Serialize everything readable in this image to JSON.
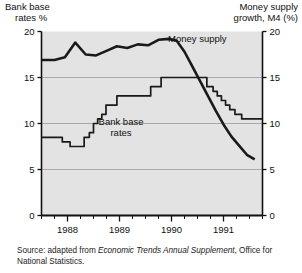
{
  "figure": {
    "left_axis_title_line1": "Bank base",
    "left_axis_title_line2": "rates %",
    "right_axis_title_line1": "Money supply",
    "right_axis_title_line2": "growth, M4 (%)",
    "money_supply_label": "Money supply",
    "bank_base_label_line1": "Bank base",
    "bank_base_label_line2": "rates",
    "source_prefix": "Source: adapted from ",
    "source_italic": "Economic Trends Annual Supplement",
    "source_suffix": ", Office for National Statistics.",
    "plot_bg": "#e3e3e3",
    "line_color": "#1a1a1a",
    "grid_color": "#9a9a9a",
    "axis_color": "#111111"
  },
  "chart_data": {
    "type": "line",
    "title": "",
    "xlabel": "",
    "ylabel": "Bank base rates %",
    "ylabel_right": "Money supply growth, M4 (%)",
    "ylim": [
      0,
      20
    ],
    "yticks": [
      0,
      5,
      10,
      15,
      20
    ],
    "yticks_right": [
      0,
      5,
      10,
      15,
      20
    ],
    "grid": true,
    "grid_lines": [
      5,
      10,
      15
    ],
    "legend": "inline-annotations",
    "xlim": [
      1987.5,
      1991.75
    ],
    "xtick_labels": [
      "1988",
      "1989",
      "1990",
      "1991"
    ],
    "xtick_label_positions": [
      1988.0,
      1989.0,
      1990.0,
      1991.0
    ],
    "xticks_minor_step": 0.25,
    "series": [
      {
        "name": "Bank base rates",
        "style": "step",
        "axis": "left",
        "x": [
          1987.5,
          1987.75,
          1987.9,
          1988.05,
          1988.2,
          1988.32,
          1988.42,
          1988.5,
          1988.58,
          1988.66,
          1988.74,
          1988.82,
          1988.95,
          1989.3,
          1989.6,
          1989.8,
          1990.55,
          1990.68,
          1990.8,
          1990.88,
          1990.96,
          1991.04,
          1991.12,
          1991.22,
          1991.35,
          1991.75
        ],
        "values": [
          8.5,
          8.5,
          8.0,
          7.5,
          7.5,
          8.5,
          9.0,
          10.0,
          10.5,
          11.0,
          12.0,
          12.0,
          13.0,
          13.0,
          14.0,
          15.0,
          15.0,
          14.0,
          13.5,
          13.0,
          12.5,
          12.0,
          11.5,
          11.0,
          10.5,
          10.5
        ]
      },
      {
        "name": "Money supply",
        "style": "line",
        "axis": "right",
        "x": [
          1987.5,
          1987.75,
          1987.95,
          1988.15,
          1988.35,
          1988.55,
          1988.75,
          1988.95,
          1989.15,
          1989.35,
          1989.55,
          1989.75,
          1989.95,
          1990.1,
          1990.25,
          1990.4,
          1990.55,
          1990.7,
          1990.85,
          1991.0,
          1991.15,
          1991.3,
          1991.45,
          1991.6
        ],
        "values": [
          16.9,
          16.9,
          17.2,
          18.8,
          17.5,
          17.4,
          17.9,
          18.4,
          18.2,
          18.6,
          18.5,
          19.1,
          19.2,
          19.0,
          17.8,
          16.2,
          14.6,
          13.0,
          11.4,
          9.9,
          8.6,
          7.6,
          6.6,
          6.1
        ]
      }
    ]
  }
}
